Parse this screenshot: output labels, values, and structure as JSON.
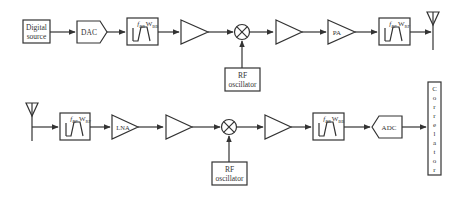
{
  "diagram": {
    "type": "RF transceiver block diagram",
    "transmitter": {
      "blocks": [
        {
          "id": "digital-source",
          "label_line1": "Digital",
          "label_line2": "source"
        },
        {
          "id": "dac",
          "label": "DAC"
        },
        {
          "id": "tx-bb-filter",
          "label_f": "f",
          "label_f_sub": "BB",
          "label_w": "W",
          "label_w_sub": "BB"
        },
        {
          "id": "tx-amp-1",
          "label": ""
        },
        {
          "id": "tx-mixer",
          "label": "⊗"
        },
        {
          "id": "tx-rf-oscillator",
          "label_line1": "RF",
          "label_line2": "oscillator"
        },
        {
          "id": "tx-amp-2",
          "label": ""
        },
        {
          "id": "pa",
          "label": "PA"
        },
        {
          "id": "tx-rf-filter",
          "label_f": "f",
          "label_f_sub": "RF",
          "label_w": "W",
          "label_w_sub": "RF"
        },
        {
          "id": "tx-antenna",
          "label": ""
        }
      ]
    },
    "receiver": {
      "blocks": [
        {
          "id": "rx-antenna",
          "label": ""
        },
        {
          "id": "rx-rf-filter",
          "label_f": "f",
          "label_f_sub": "RF",
          "label_w": "W",
          "label_w_sub": "RF"
        },
        {
          "id": "lna",
          "label": "LNA"
        },
        {
          "id": "rx-amp-1",
          "label": ""
        },
        {
          "id": "rx-mixer",
          "label": "⊗"
        },
        {
          "id": "rx-rf-oscillator",
          "label_line1": "RF",
          "label_line2": "oscillator"
        },
        {
          "id": "rx-amp-2",
          "label": ""
        },
        {
          "id": "rx-bb-filter",
          "label_f": "f",
          "label_f_sub": "BB",
          "label_w": "W",
          "label_w_sub": "BB"
        },
        {
          "id": "adc",
          "label": "ADC"
        },
        {
          "id": "correlator",
          "label": "Correlator",
          "letters": [
            "C",
            "o",
            "r",
            "r",
            "e",
            "l",
            "a",
            "t",
            "o",
            "r"
          ]
        }
      ]
    },
    "colors": {
      "stroke": "#333333",
      "background": "#ffffff"
    }
  }
}
